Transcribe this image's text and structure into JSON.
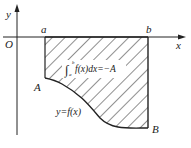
{
  "figure": {
    "axes": {
      "x_label": "x",
      "y_label": "y",
      "origin_label": "O"
    },
    "points": {
      "a_label": "a",
      "b_label": "b",
      "A_label": "A",
      "B_label": "B"
    },
    "curve_label": "y=f(x)",
    "integral": {
      "lower": "a",
      "upper": "b",
      "body": "f(x)dx=−A"
    },
    "colors": {
      "stroke": "#222222",
      "background": "#ffffff"
    }
  }
}
